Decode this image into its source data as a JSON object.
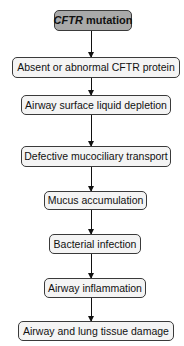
{
  "diagram": {
    "type": "flowchart",
    "direction": "top-to-bottom",
    "root": {
      "italic_part": "CFTR",
      "rest": " mutation",
      "fill": "#a9a9a9"
    },
    "nodes": [
      {
        "id": "n1",
        "label": "CFTR mutation"
      },
      {
        "id": "n2",
        "label": "Absent or abnormal CFTR protein"
      },
      {
        "id": "n3",
        "label": "Airway surface liquid depletion"
      },
      {
        "id": "n4",
        "label": "Defective mucociliary transport"
      },
      {
        "id": "n5",
        "label": "Mucus accumulation"
      },
      {
        "id": "n6",
        "label": "Bacterial infection"
      },
      {
        "id": "n7",
        "label": "Airway inflammation"
      },
      {
        "id": "n8",
        "label": "Airway and lung tissue damage"
      }
    ],
    "edges": [
      [
        "n1",
        "n2"
      ],
      [
        "n2",
        "n3"
      ],
      [
        "n3",
        "n4"
      ],
      [
        "n4",
        "n5"
      ],
      [
        "n5",
        "n6"
      ],
      [
        "n6",
        "n7"
      ],
      [
        "n7",
        "n8"
      ]
    ]
  }
}
